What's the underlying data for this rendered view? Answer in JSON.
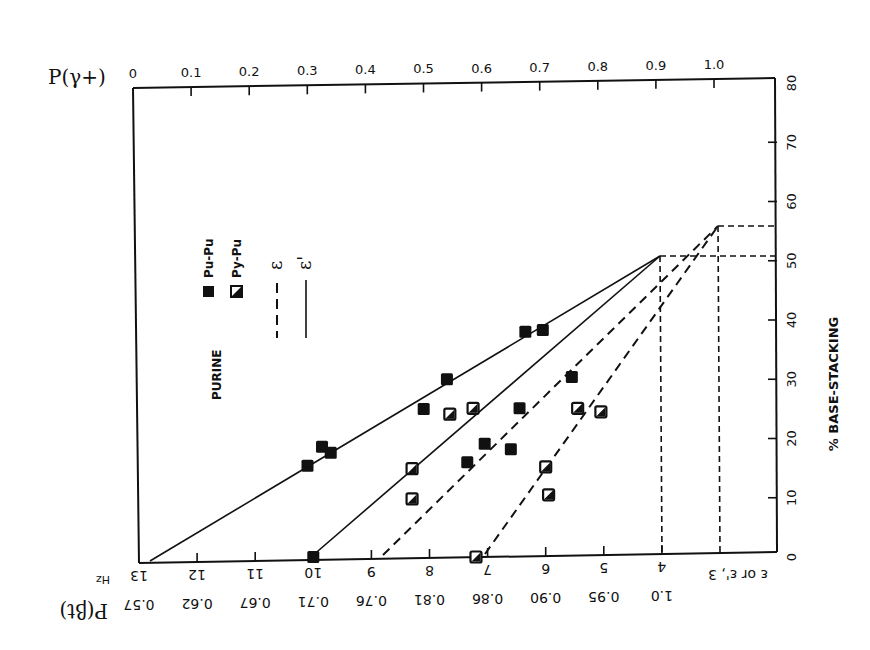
{
  "chart_data": {
    "type": "scatter",
    "title": "",
    "annotation": "PURINE",
    "xlabel": "Hz (ε or ε')",
    "xlabel_bottom_secondary": "P(βt)",
    "xlabel_top": "P(γ+)",
    "ylabel": "% BASE-STACKING",
    "xlim": [
      13,
      3
    ],
    "ylim": [
      0,
      80
    ],
    "x_ticks_bottom": [
      "13",
      "12",
      "11",
      "10",
      "9",
      "8",
      "7",
      "6",
      "5",
      "4",
      "3"
    ],
    "x_ticks_bottom_unit": "Hz",
    "x_ticks_bottom_corner_label": "ε or ε'",
    "x_ticks_secondary": [
      "0.57",
      "0.62",
      "0.67",
      "0.71",
      "0.76",
      "0.81",
      "0.86",
      "0.90",
      "0.95",
      "1.0"
    ],
    "x_ticks_top": [
      "0",
      "0.1",
      "0.2",
      "0.3",
      "0.4",
      "0.5",
      "0.6",
      "0.7",
      "0.8",
      "0.9",
      "1.0"
    ],
    "y_ticks": [
      "0",
      "10",
      "20",
      "30",
      "40",
      "50",
      "60",
      "70",
      "80"
    ],
    "grid": false,
    "legend": [
      {
        "label": "Pu-Pu",
        "marker": "filled-square"
      },
      {
        "label": "Py-Pu",
        "marker": "half-filled-square"
      },
      {
        "label": "ε",
        "line": "dashed"
      },
      {
        "label": "ε'",
        "line": "solid"
      }
    ],
    "legend_position": "inside-left",
    "series": [
      {
        "name": "Pu-Pu",
        "marker": "filled-square",
        "points": [
          {
            "x": 10.1,
            "y": 15.4
          },
          {
            "x": 9.85,
            "y": 18.6
          },
          {
            "x": 9.7,
            "y": 17.6
          },
          {
            "x": 8.1,
            "y": 25.0
          },
          {
            "x": 7.7,
            "y": 30.0
          },
          {
            "x": 6.35,
            "y": 38.0
          },
          {
            "x": 6.05,
            "y": 38.3
          },
          {
            "x": 7.35,
            "y": 16.0
          },
          {
            "x": 7.05,
            "y": 19.1
          },
          {
            "x": 6.45,
            "y": 25.1
          },
          {
            "x": 6.6,
            "y": 18.2
          },
          {
            "x": 5.55,
            "y": 30.4
          },
          {
            "x": 10.0,
            "y": 0
          }
        ]
      },
      {
        "name": "Py-Pu",
        "marker": "half-filled-square",
        "points": [
          {
            "x": 8.3,
            "y": 14.9
          },
          {
            "x": 8.3,
            "y": 9.8
          },
          {
            "x": 7.65,
            "y": 24.1
          },
          {
            "x": 7.25,
            "y": 25.1
          },
          {
            "x": 5.45,
            "y": 25.1
          },
          {
            "x": 5.05,
            "y": 24.5
          },
          {
            "x": 6.0,
            "y": 15.2
          },
          {
            "x": 5.95,
            "y": 10.5
          },
          {
            "x": 7.2,
            "y": 0
          }
        ]
      }
    ],
    "lines": [
      {
        "name": "ε' (Pu-Pu)",
        "style": "solid",
        "from": {
          "x": 12.8,
          "y": 0
        },
        "to": {
          "x": 4,
          "y": 50
        }
      },
      {
        "name": "ε' (Py-Pu)",
        "style": "solid",
        "from": {
          "x": 10.0,
          "y": 0
        },
        "to": {
          "x": 4,
          "y": 50
        }
      },
      {
        "name": "ε (Pu-Pu)",
        "style": "dashed",
        "from": {
          "x": 8.75,
          "y": 0
        },
        "to": {
          "x": 3,
          "y": 55
        }
      },
      {
        "name": "ε (Py-Pu)",
        "style": "dashed",
        "from": {
          "x": 7.0,
          "y": 0
        },
        "to": {
          "x": 3,
          "y": 55
        }
      }
    ],
    "reference_lines": [
      {
        "type": "horizontal",
        "y": 50,
        "from_x": 4,
        "style": "dashed"
      },
      {
        "type": "horizontal",
        "y": 55,
        "from_x": 3,
        "style": "dashed"
      },
      {
        "type": "vertical",
        "x": 4,
        "to_y": 50,
        "style": "dashed"
      },
      {
        "type": "vertical",
        "x": 3,
        "to_y": 55,
        "style": "dashed"
      }
    ]
  },
  "labels": {
    "top_axis_title": "P(γ+)",
    "bottom_axis_title": "P(βt)",
    "right_axis_title": "% BASE-STACKING",
    "unit_hz": "Hz",
    "corner_label": "ε or ε', 3",
    "annotation": "PURINE",
    "legend_pupu": "Pu-Pu",
    "legend_pypu": "Py-Pu",
    "legend_eps": "ε",
    "legend_eps_prime": "ε'"
  }
}
